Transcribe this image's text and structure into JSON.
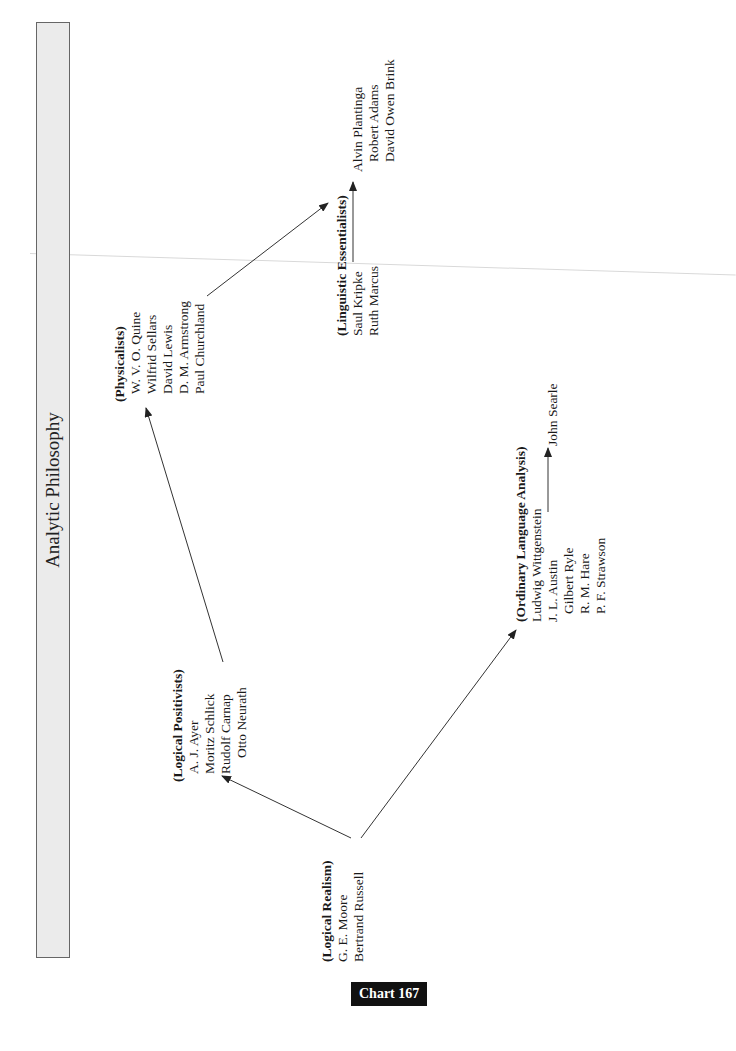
{
  "title": "Analytic Philosophy",
  "chart_label": "Chart 167",
  "groups": {
    "logical_realism": {
      "heading": "(Logical Realism)",
      "members": [
        "G. E. Moore",
        "Bertrand Russell"
      ]
    },
    "logical_positivists": {
      "heading": "(Logical Positivists)",
      "members": [
        "A. J. Ayer",
        "Moritz Schlick",
        "Rudolf Carnap",
        "Otto Neurath"
      ]
    },
    "physicalists": {
      "heading": "(Physicalists)",
      "members": [
        "W. V. O. Quine",
        "Wilfrid Sellars",
        "David Lewis",
        "D. M. Armstrong",
        "Paul Churchland"
      ]
    },
    "linguistic_essentialists": {
      "heading": "(Linguistic Essentialists)",
      "members": [
        "Saul Kripke",
        "Ruth Marcus"
      ],
      "followers": [
        "Alvin Plantinga",
        "Robert Adams",
        "David Owen Brink"
      ]
    },
    "ordinary_language": {
      "heading": "(Ordinary Language Analysis)",
      "members": [
        "Ludwig Wittgenstein",
        "J. L. Austin",
        "Gilbert Ryle",
        "R. M. Hare",
        "P. F. Strawson"
      ],
      "followers": [
        "John Searle"
      ]
    }
  },
  "edges": [
    {
      "from": "Logical Realism",
      "to": "Logical Positivists"
    },
    {
      "from": "Logical Realism",
      "to": "Ordinary Language Analysis"
    },
    {
      "from": "Logical Positivists",
      "to": "Physicalists"
    },
    {
      "from": "Physicalists",
      "to": "Linguistic Essentialists"
    },
    {
      "from": "Saul Kripke",
      "to": "Alvin Plantinga"
    },
    {
      "from": "J. L. Austin",
      "to": "John Searle"
    }
  ],
  "colors": {
    "title_box_fill": "#ebebeb",
    "title_box_border": "#666666",
    "label_bg": "#111111",
    "label_text": "#ffffff",
    "arrow": "#333333"
  }
}
